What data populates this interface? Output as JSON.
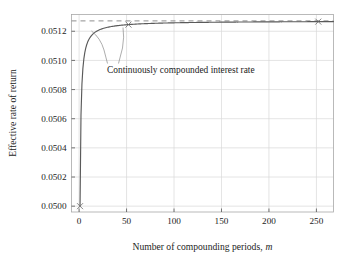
{
  "chart_data": {
    "type": "line",
    "title": "",
    "xlabel": "Number of compounding periods, m",
    "xlabel_plain": "Number of compounding periods,",
    "xlabel_italic": "m",
    "ylabel": "Effective rate of return",
    "xlim": [
      -8,
      268
    ],
    "ylim": [
      0.04996,
      0.051315
    ],
    "xticks": [
      0,
      50,
      100,
      150,
      200,
      250
    ],
    "xtick_labels": [
      "0",
      "50",
      "100",
      "150",
      "200",
      "250"
    ],
    "yticks": [
      0.05,
      0.0502,
      0.0504,
      0.0506,
      0.0508,
      0.051,
      0.0512
    ],
    "ytick_labels": [
      "0.0500",
      "0.0502",
      "0.0504",
      "0.0506",
      "0.0508",
      "0.0510",
      "0.0512"
    ],
    "grid": true,
    "legend": "none",
    "nominal_rate": 0.05,
    "asymptote_value": 0.0512711,
    "asymptote_label": "Continuously compounded interest rate",
    "annotations": [
      {
        "text": "Continuously compounded interest rate",
        "x_px": 107,
        "y_px": 70
      }
    ],
    "series": [
      {
        "name": "Effective rate (1 + 0.05/m)^m - 1",
        "x": [
          1,
          2,
          4,
          6,
          12,
          24,
          52,
          100,
          150,
          200,
          252
        ],
        "values": [
          0.05,
          0.050625,
          0.0509453,
          0.0510522,
          0.0511619,
          0.0512172,
          0.0512459,
          0.0512585,
          0.0512627,
          0.0512648,
          0.0512661
        ]
      },
      {
        "name": "Continuously compounded limit",
        "x": [
          0,
          268
        ],
        "values": [
          0.0512711,
          0.0512711
        ]
      }
    ],
    "markers": [
      {
        "x": 1,
        "y": 0.05
      },
      {
        "x": 52,
        "y": 0.0512459
      },
      {
        "x": 252,
        "y": 0.0512661
      }
    ]
  },
  "colors": {
    "curve": "#5a5a5a",
    "asymptote": "#8e8e8e",
    "grid": "#d9d9d9",
    "frame": "#a8a8a8",
    "text": "#1c1c1c",
    "background": "#ffffff"
  }
}
